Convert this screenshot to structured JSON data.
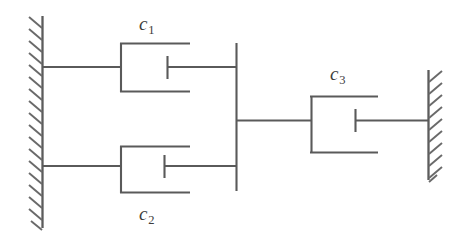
{
  "figure": {
    "type": "mechanical-schematic",
    "title": "",
    "background_color": "#ffffff",
    "line_color": "#5a5a5a"
  },
  "labels": {
    "c1": {
      "symbol": "c",
      "subscript": "1",
      "text": "c1"
    },
    "c2": {
      "symbol": "c",
      "subscript": "2",
      "text": "c2"
    },
    "c3": {
      "symbol": "c",
      "subscript": "3",
      "text": "c3"
    }
  },
  "elements": {
    "left_wall": {
      "name": "fixed-support-left",
      "hatching": "diagonal",
      "hatch_side": "left"
    },
    "right_wall": {
      "name": "fixed-support-right",
      "hatching": "diagonal",
      "hatch_side": "right"
    },
    "damper_c1": {
      "name": "damper-c1",
      "label_position": "above"
    },
    "damper_c2": {
      "name": "damper-c2",
      "label_position": "below"
    },
    "damper_c3": {
      "name": "damper-c3",
      "label_position": "above"
    },
    "connector_bar": {
      "name": "rigid-connector-bar",
      "orientation": "vertical"
    }
  }
}
